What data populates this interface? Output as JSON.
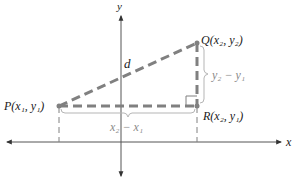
{
  "diagram": {
    "axes": {
      "x_label": "x",
      "y_label": "y"
    },
    "points": {
      "P": {
        "name": "P",
        "label": "P(x₁, y₁)",
        "coords_text": "(x1, y1)"
      },
      "Q": {
        "name": "Q",
        "label": "Q(x₂, y₂)",
        "coords_text": "(x2, y2)"
      },
      "R": {
        "name": "R",
        "label": "R(x₂, y₁)",
        "coords_text": "(x2, y1)"
      }
    },
    "segments": {
      "hypotenuse_label": "d",
      "horizontal_label": "x₂ − x₁",
      "vertical_label": "y₂ − y₁"
    },
    "colors": {
      "axis": "#555555",
      "dashed_triangle": "#808080",
      "brace": "#b5b5b5",
      "label_dark": "#1a1a1a",
      "label_gray": "#8a8a8a"
    }
  }
}
